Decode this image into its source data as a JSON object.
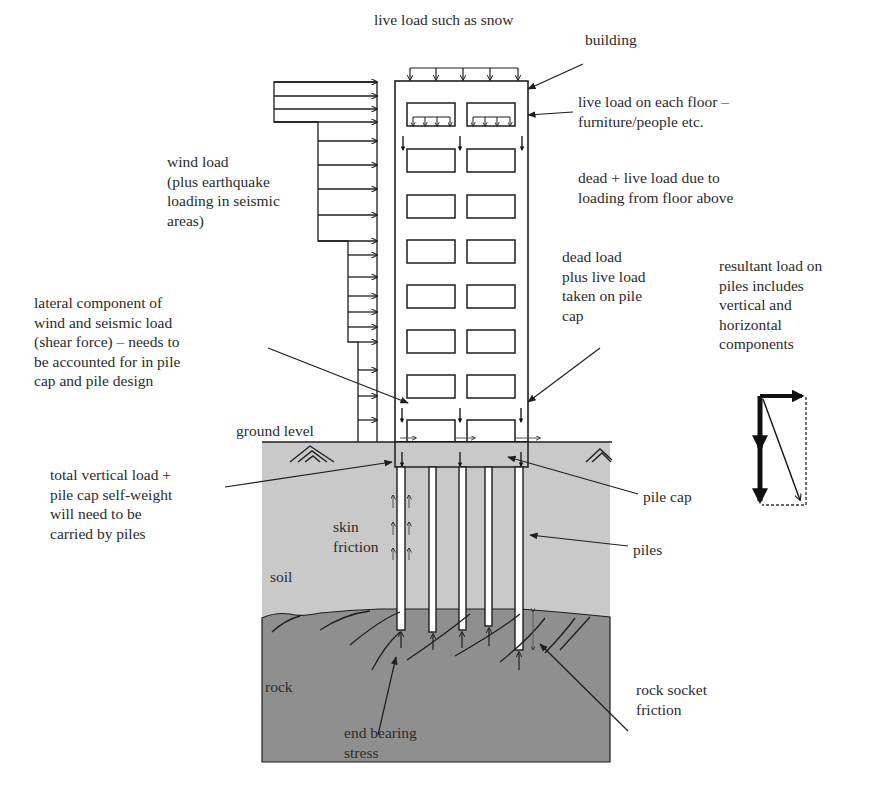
{
  "diagram": {
    "colors": {
      "background": "#ffffff",
      "soil": "#c9c9c9",
      "rock": "#8f8f8f",
      "line": "#1e1e1e",
      "text": "#2b2b2b",
      "pile": "#ffffff"
    },
    "labels": {
      "live_load_snow": "live load such as snow",
      "building": "building",
      "live_load_floor": "live load on each floor –\nfurniture/people etc.",
      "dead_live_floor_above": "dead + live load due to\nloading from floor above",
      "wind_load": "wind load\n(plus earthquake\nloading in seismic\nareas)",
      "dead_load_pile_cap": "dead load\nplus live load\ntaken on pile\ncap",
      "resultant_load": "resultant load on\npiles includes\nvertical and\nhorizontal\ncomponents",
      "lateral_component": "lateral component of\nwind and seismic load\n(shear force) – needs to\nbe accounted for in pile\ncap and pile design",
      "ground_level": "ground level",
      "total_vertical_load": "total vertical load +\npile cap self-weight\nwill need to be\ncarried by piles",
      "skin_friction": "skin\nfriction",
      "pile_cap": "pile cap",
      "piles": "piles",
      "soil": "soil",
      "rock": "rock",
      "end_bearing": "end bearing\nstress",
      "rock_socket": "rock socket\nfriction"
    },
    "building": {
      "floors_with_windows": 8,
      "windows_per_floor": 2
    },
    "piles": {
      "count": 5
    }
  }
}
